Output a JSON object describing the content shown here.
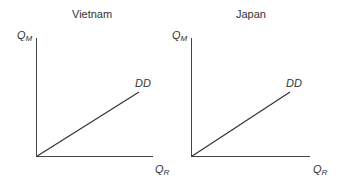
{
  "panels": [
    {
      "title": "Vietnam",
      "y_axis": {
        "label": "Q",
        "sub": "M"
      },
      "x_axis": {
        "label": "Q",
        "sub": "R"
      },
      "curve_label": "DD",
      "color": "#333333"
    },
    {
      "title": "Japan",
      "y_axis": {
        "label": "Q",
        "sub": "M"
      },
      "x_axis": {
        "label": "Q",
        "sub": "R"
      },
      "curve_label": "DD",
      "color": "#333333"
    }
  ]
}
